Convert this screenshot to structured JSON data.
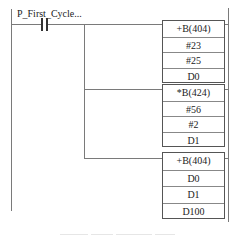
{
  "diagram": {
    "type": "ladder-logic",
    "contact": {
      "label": "P_First_Cycle...",
      "kind": "normally-open"
    },
    "function_blocks": [
      {
        "instruction": "+B(404)",
        "operands": [
          "#23",
          "#25",
          "D0"
        ]
      },
      {
        "instruction": "*B(424)",
        "operands": [
          "#56",
          "#2",
          "D1"
        ]
      },
      {
        "instruction": "+B(404)",
        "operands": [
          "D0",
          "D1",
          "D100"
        ]
      }
    ],
    "caption": ""
  },
  "colors": {
    "line": "#7a7a7a",
    "box_border": "#555555",
    "text": "#222222"
  }
}
